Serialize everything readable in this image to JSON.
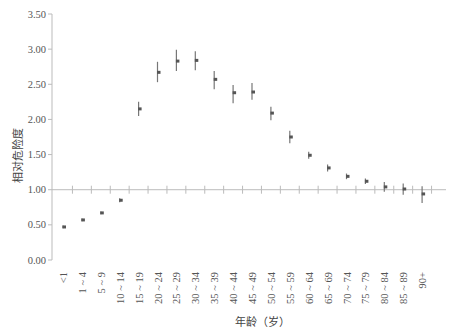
{
  "chart_data": {
    "type": "scatter",
    "subtype": "point-with-error-bars",
    "title": "",
    "xlabel": "年龄（岁）",
    "ylabel": "相对危险度",
    "ylim": [
      0,
      3.5
    ],
    "yticks": [
      "0.00",
      "0.50",
      "1.00",
      "1.50",
      "2.00",
      "2.50",
      "3.00",
      "3.50"
    ],
    "reference_line": 1.0,
    "grid": false,
    "categories": [
      "<1",
      "1 ~ 4",
      "5 ~ 9",
      "10 ~ 14",
      "15 ~ 19",
      "20 ~ 24",
      "25 ~ 29",
      "30 ~ 34",
      "35 ~ 39",
      "40 ~ 44",
      "45 ~ 49",
      "50 ~ 54",
      "55 ~ 59",
      "60 ~ 64",
      "65 ~ 69",
      "70 ~ 74",
      "75 ~ 79",
      "80 ~ 84",
      "85 ~ 89",
      "90+"
    ],
    "series": [
      {
        "name": "相对危险度",
        "values": [
          0.47,
          0.57,
          0.67,
          0.85,
          2.15,
          2.67,
          2.83,
          2.84,
          2.57,
          2.38,
          2.39,
          2.09,
          1.75,
          1.49,
          1.31,
          1.19,
          1.12,
          1.04,
          1.01,
          0.94
        ],
        "lower": [
          0.45,
          0.55,
          0.65,
          0.82,
          2.05,
          2.53,
          2.69,
          2.7,
          2.43,
          2.23,
          2.28,
          1.99,
          1.66,
          1.44,
          1.26,
          1.15,
          1.08,
          0.97,
          0.93,
          0.81
        ],
        "upper": [
          0.49,
          0.59,
          0.69,
          0.88,
          2.25,
          2.82,
          2.99,
          2.97,
          2.69,
          2.49,
          2.52,
          2.18,
          1.84,
          1.54,
          1.36,
          1.23,
          1.16,
          1.11,
          1.09,
          1.05
        ]
      }
    ]
  }
}
